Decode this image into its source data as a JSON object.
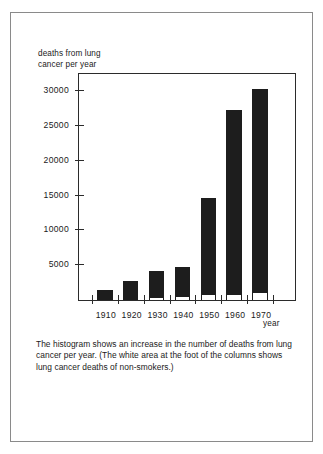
{
  "page": {
    "background": "#ffffff",
    "border_color": "#8a8a8a"
  },
  "figure": {
    "y_axis_title": "deaths from lung\ncancer per year",
    "x_axis_title": "year",
    "caption": "The histogram shows an increase in the number of deaths from lung cancer per year. (The white area at the foot of the columns shows lung cancer deaths of non-smokers.)"
  },
  "chart_data": {
    "type": "bar",
    "title": "",
    "subtitle": "",
    "xlabel": "year",
    "ylabel": "deaths from lung cancer per year",
    "categories": [
      "1910",
      "1920",
      "1930",
      "1940",
      "1950",
      "1960",
      "1970"
    ],
    "values": [
      1500,
      2800,
      4200,
      4700,
      14700,
      27300,
      30300
    ],
    "series": [
      {
        "name": "lung cancer deaths of non-smokers",
        "values": [
          0,
          0,
          500,
          600,
          900,
          900,
          1200
        ]
      }
    ],
    "ylim": [
      0,
      32500
    ],
    "yticks": [
      5000,
      10000,
      15000,
      20000,
      25000,
      30000
    ],
    "ytick_labels": [
      "5000",
      "10000",
      "15000",
      "20000",
      "25000",
      "30000"
    ],
    "xtick_labels": [
      "1910",
      "1920",
      "1930",
      "1940",
      "1950",
      "1960",
      "1970"
    ],
    "grid": false,
    "legend": "none",
    "bar_color": "#1d1d1d",
    "foot_color": "#ffffff",
    "axis_color": "#2b2b2b"
  }
}
